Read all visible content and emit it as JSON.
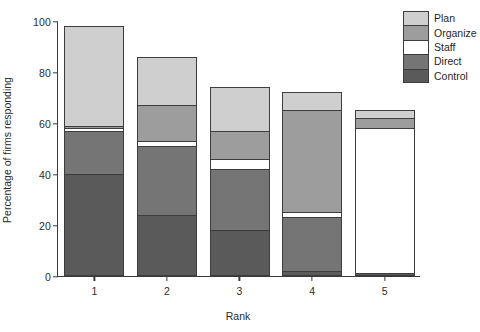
{
  "chart_data": {
    "type": "bar",
    "stacked": true,
    "title": "",
    "xlabel": "Rank",
    "ylabel": "Percentage of firms responding",
    "categories": [
      "1",
      "2",
      "3",
      "4",
      "5"
    ],
    "ylim": [
      0,
      100
    ],
    "yticks": [
      0,
      20,
      40,
      60,
      80,
      100
    ],
    "grid": false,
    "legend_position": "top-right",
    "series": [
      {
        "name": "Plan",
        "color": "#cfcfcf",
        "values": [
          39,
          19,
          17,
          7,
          3
        ]
      },
      {
        "name": "Organize",
        "color": "#9d9d9d",
        "values": [
          1,
          14,
          11,
          40,
          4
        ]
      },
      {
        "name": "Staff",
        "color": "#ffffff",
        "values": [
          1,
          2,
          4,
          2,
          57
        ]
      },
      {
        "name": "Direct",
        "color": "#757575",
        "values": [
          17,
          27,
          24,
          21,
          0
        ]
      },
      {
        "name": "Control",
        "color": "#5a5a5a",
        "values": [
          40,
          24,
          18,
          2,
          1
        ]
      }
    ],
    "totals": [
      98,
      86,
      74,
      72,
      65
    ],
    "stack_order_bottom_to_top": [
      "Control",
      "Direct",
      "Staff",
      "Organize",
      "Plan"
    ]
  },
  "legend": {
    "items": [
      {
        "label": "Plan"
      },
      {
        "label": "Organize"
      },
      {
        "label": "Staff"
      },
      {
        "label": "Direct"
      },
      {
        "label": "Control"
      }
    ]
  },
  "axes": {
    "y_title": "Percentage of firms responding",
    "x_title": "Rank",
    "y_tick_labels": [
      "0",
      "20",
      "40",
      "60",
      "80",
      "100"
    ],
    "x_tick_labels": [
      "1",
      "2",
      "3",
      "4",
      "5"
    ]
  }
}
